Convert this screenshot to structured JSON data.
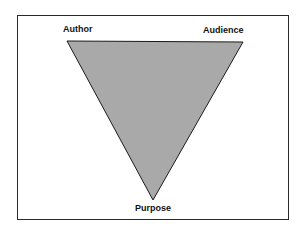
{
  "diagram": {
    "type": "inverted-triangle",
    "vertices": {
      "top_left": "Author",
      "top_right": "Audience",
      "bottom": "Purpose"
    },
    "fill_color": "#a9a9a9",
    "stroke_color": "#1a1a1a"
  }
}
